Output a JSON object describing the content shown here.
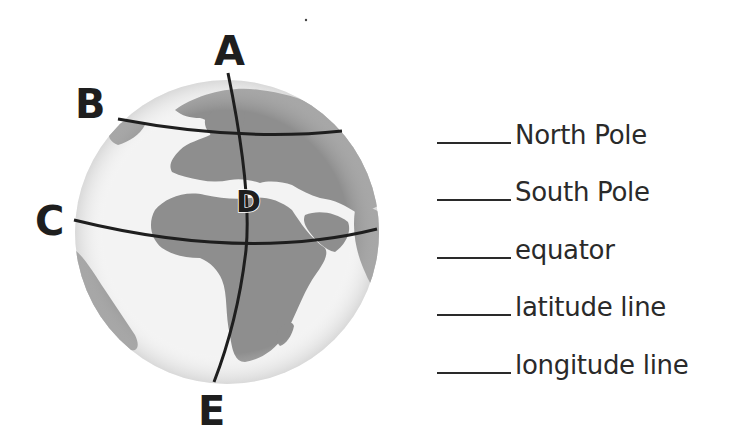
{
  "globe": {
    "labels": {
      "A": "A",
      "B": "B",
      "C": "C",
      "D": "D",
      "E": "E"
    },
    "colors": {
      "ocean": "#f2f2f2",
      "land": "#8c8c8c",
      "lines": "#1e1e1e"
    }
  },
  "answers": [
    {
      "blank": "",
      "term": "North Pole"
    },
    {
      "blank": "",
      "term": "South Pole"
    },
    {
      "blank": "",
      "term": "equator"
    },
    {
      "blank": "",
      "term": "latitude line"
    },
    {
      "blank": "",
      "term": "longitude line"
    }
  ]
}
